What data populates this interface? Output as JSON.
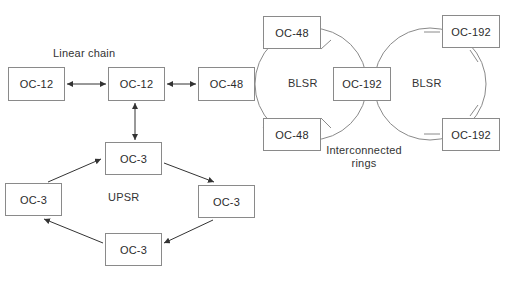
{
  "diagram": {
    "title_labels": {
      "linear_chain": "Linear chain",
      "upsr": "UPSR",
      "blsr_left": "BLSR",
      "blsr_right": "BLSR",
      "interconnected_rings": "Interconnected rings"
    },
    "nodes": [
      {
        "id": "lc-oc12-a",
        "label": "OC-12",
        "x": 8,
        "y": 67,
        "w": 57,
        "h": 34
      },
      {
        "id": "lc-oc12-b",
        "label": "OC-12",
        "x": 108,
        "y": 67,
        "w": 57,
        "h": 34
      },
      {
        "id": "lc-oc48",
        "label": "OC-48",
        "x": 198,
        "y": 67,
        "w": 57,
        "h": 34
      },
      {
        "id": "blsr1-oc48-top",
        "label": "OC-48",
        "x": 263,
        "y": 16,
        "w": 58,
        "h": 33
      },
      {
        "id": "blsr1-oc48-bottom",
        "label": "OC-48",
        "x": 263,
        "y": 118,
        "w": 58,
        "h": 33
      },
      {
        "id": "center-oc192",
        "label": "OC-192",
        "x": 333,
        "y": 67,
        "w": 58,
        "h": 34
      },
      {
        "id": "blsr2-oc192-top",
        "label": "OC-192",
        "x": 442,
        "y": 15,
        "w": 58,
        "h": 33
      },
      {
        "id": "blsr2-oc192-bottom",
        "label": "OC-192",
        "x": 442,
        "y": 118,
        "w": 58,
        "h": 33
      },
      {
        "id": "upsr-oc3-top",
        "label": "OC-3",
        "x": 105,
        "y": 142,
        "w": 57,
        "h": 33
      },
      {
        "id": "upsr-oc3-left",
        "label": "OC-3",
        "x": 5,
        "y": 183,
        "w": 57,
        "h": 33
      },
      {
        "id": "upsr-oc3-right",
        "label": "OC-3",
        "x": 198,
        "y": 185,
        "w": 57,
        "h": 33
      },
      {
        "id": "upsr-oc3-bottom",
        "label": "OC-3",
        "x": 105,
        "y": 233,
        "w": 57,
        "h": 33
      }
    ],
    "colors": {
      "stroke": "#8a8a8a",
      "line": "#555555",
      "text": "#2b2b2b",
      "background": "#ffffff"
    }
  }
}
